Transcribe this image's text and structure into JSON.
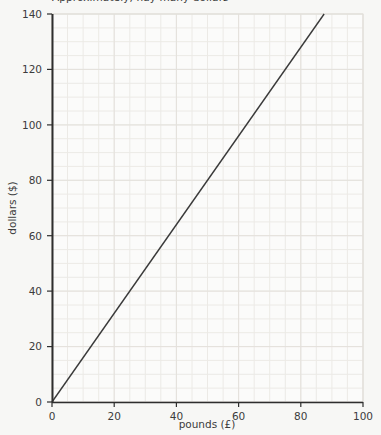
{
  "chart_data": {
    "type": "line",
    "title": "Approximately, hay many dollars",
    "xlabel": "pounds (£)",
    "ylabel": "dollars ($)",
    "xlim": [
      0,
      100
    ],
    "ylim": [
      0,
      140
    ],
    "xticks": [
      0,
      20,
      40,
      60,
      80,
      100
    ],
    "yticks": [
      0,
      20,
      40,
      60,
      80,
      100,
      120,
      140
    ],
    "xtick_labels": [
      "0",
      "20",
      "40",
      "60",
      "80",
      "100"
    ],
    "ytick_labels": [
      "0",
      "20",
      "40",
      "60",
      "80",
      "100",
      "120",
      "140"
    ],
    "grid": true,
    "grid_minor_step_x": 5,
    "grid_minor_step_y": 5,
    "legend": null,
    "series": [
      {
        "name": "pounds to dollars conversion",
        "slope": 1.6,
        "intercept": 0,
        "x": [
          0,
          87.5
        ],
        "y": [
          0,
          140
        ],
        "color": "#3a3a3a",
        "line_width": 1.4
      }
    ],
    "colors": {
      "background": "#f7f7f5",
      "plot_background": "#fbfbfa",
      "grid_minor": "#eceae6",
      "grid_major": "#e4e1dc",
      "axis": "#2e2e2e",
      "text": "#3c3c3c",
      "line": "#3a3a3a"
    }
  }
}
